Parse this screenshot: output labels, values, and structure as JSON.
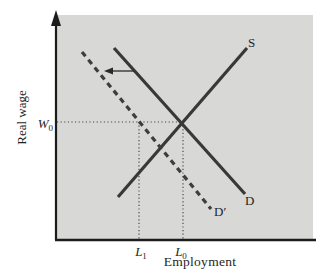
{
  "figure": {
    "y_axis_title": "Real wage",
    "x_axis_title": "Employment",
    "colors": {
      "background": "#ffffff",
      "panel": "#d8d8d7",
      "axis": "#1c1c1c",
      "curve": "#383838",
      "dashed_curve": "#3d3d3d",
      "guide": "#4a4a4a",
      "arrow": "#2a2a2a",
      "text": "#1f1f1f"
    }
  },
  "labels": {
    "w0": {
      "base": "W",
      "sub": "0"
    },
    "l1": {
      "base": "L",
      "sub": "1"
    },
    "l0": {
      "base": "L",
      "sub": "0"
    },
    "supply": "S",
    "demand": "D",
    "demand_shifted": "D′"
  },
  "chart_data": {
    "type": "line",
    "title": "",
    "xlabel": "Employment",
    "ylabel": "Real wage",
    "x_ticks": [
      "L1",
      "L0"
    ],
    "y_ticks": [
      "W0"
    ],
    "annotations": [
      "S",
      "D",
      "D′",
      "leftward shift arrow from D to D′"
    ],
    "series": [
      {
        "name": "S",
        "role": "labor-supply",
        "style": "solid",
        "points_px": [
          [
            118,
            197
          ],
          [
            247,
            48
          ]
        ]
      },
      {
        "name": "D",
        "role": "labor-demand-initial",
        "style": "solid",
        "points_px": [
          [
            114,
            48
          ],
          [
            245,
            194
          ]
        ]
      },
      {
        "name": "D′",
        "role": "labor-demand-shifted",
        "style": "dashed",
        "points_px": [
          [
            82,
            52
          ],
          [
            211,
            209
          ]
        ]
      }
    ],
    "guides": [
      {
        "name": "w0-horizontal-dotted",
        "points_px": [
          [
            57,
            122
          ],
          [
            183,
            122
          ]
        ]
      },
      {
        "name": "l1-vertical-dotted",
        "points_px": [
          [
            139,
            122
          ],
          [
            139,
            240
          ]
        ]
      },
      {
        "name": "l0-vertical-dotted",
        "points_px": [
          [
            183,
            122
          ],
          [
            183,
            240
          ]
        ]
      }
    ],
    "shift_arrow": {
      "from_px": [
        134,
        71
      ],
      "to_px": [
        104,
        71
      ],
      "direction": "left"
    },
    "key_points": {
      "equilibrium_px": [
        183,
        122
      ],
      "meaning": "At wage W0, demand shift D to D′ lowers employment from L0 to L1"
    }
  }
}
